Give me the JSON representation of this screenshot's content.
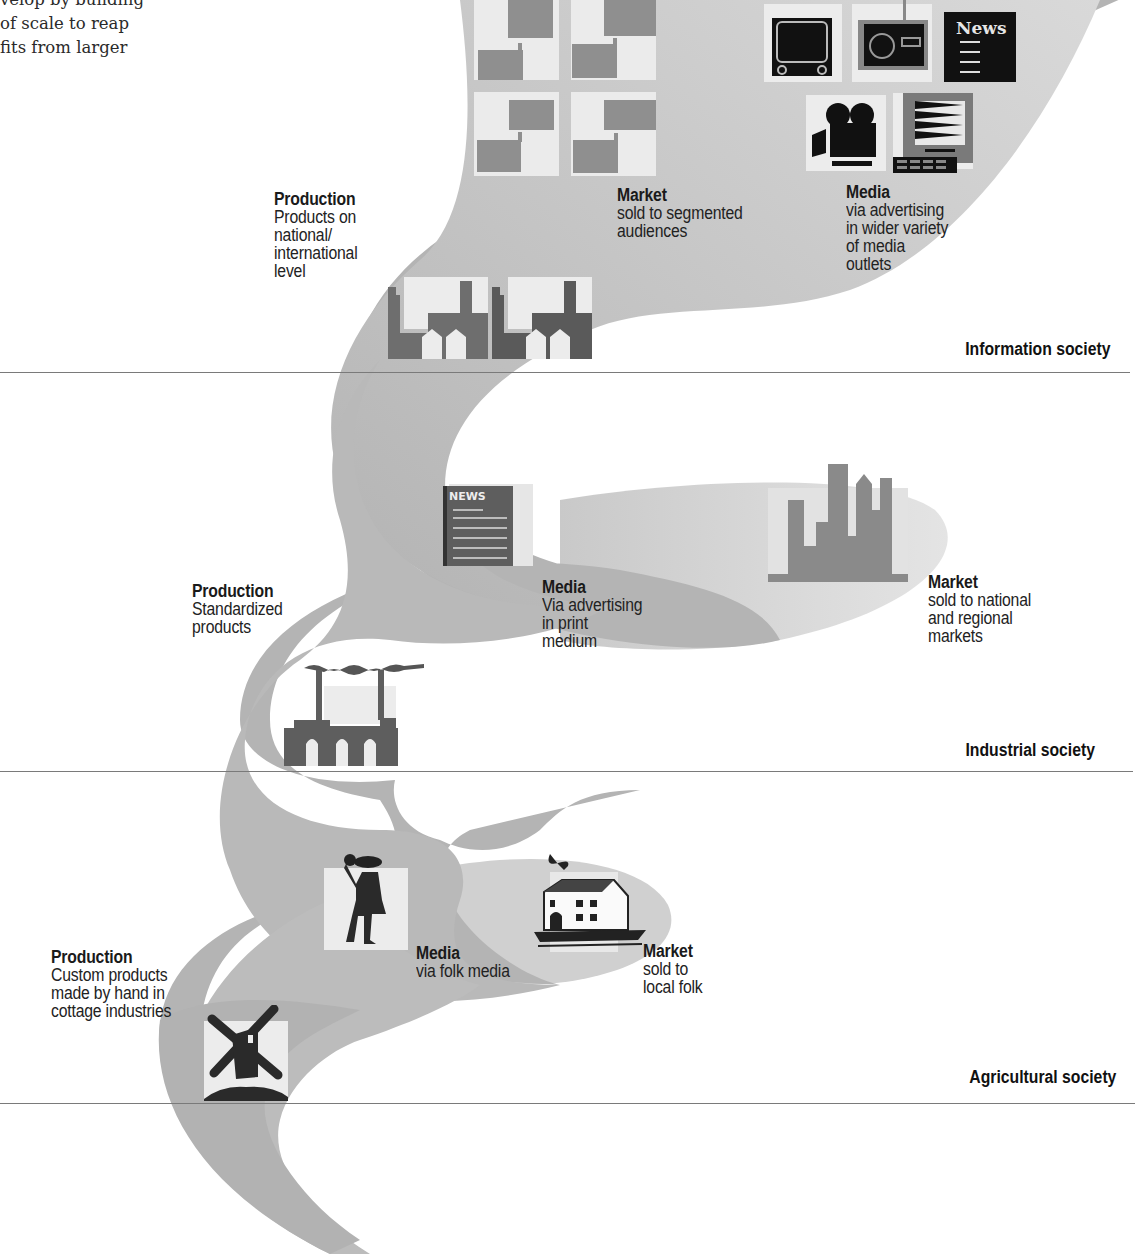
{
  "intro_text": "velop by building\nof scale to reap\nfits from larger",
  "eras": [
    {
      "id": "information",
      "label": "Information society"
    },
    {
      "id": "industrial",
      "label": "Industrial society"
    },
    {
      "id": "agricultural",
      "label": "Agricultural society"
    }
  ],
  "information": {
    "production": {
      "heading": "Production",
      "body": "Products on\nnational/\ninternational\nlevel",
      "icon": "modern-factory-icon"
    },
    "market": {
      "heading": "Market",
      "body": "sold to segmented\naudiences",
      "icon": "factory-grid-icon"
    },
    "media": {
      "heading": "Media",
      "body": "via advertising\nin wider variety\nof media\noutlets",
      "icons": [
        "television-icon",
        "radio-icon",
        "newspaper-icon",
        "movie-camera-icon",
        "computer-icon"
      ],
      "newspaper_title": "News"
    }
  },
  "industrial": {
    "production": {
      "heading": "Production",
      "body": "Standardized\nproducts",
      "icon": "smokestack-factory-icon"
    },
    "media": {
      "heading": "Media",
      "body": "Via advertising\nin print\nmedium",
      "icon": "print-newspaper-icon",
      "newspaper_title": "NEWS"
    },
    "market": {
      "heading": "Market",
      "body": "sold to national\nand regional\nmarkets",
      "icon": "city-skyline-icon"
    }
  },
  "agricultural": {
    "production": {
      "heading": "Production",
      "body": "Custom products\nmade by hand in\ncottage industries",
      "icon": "windmill-icon"
    },
    "media": {
      "heading": "Media",
      "body": "via folk media",
      "icon": "town-crier-icon"
    },
    "market": {
      "heading": "Market",
      "body": "sold to\nlocal folk",
      "icon": "cottage-icon"
    }
  },
  "colors": {
    "band_dark": "#a9a9a9",
    "band_mid": "#bdbdbd",
    "band_light": "#d6d6d6",
    "icon_tile": "#ececec",
    "icon_dark": "#555555",
    "rule": "#7a7a7a"
  }
}
